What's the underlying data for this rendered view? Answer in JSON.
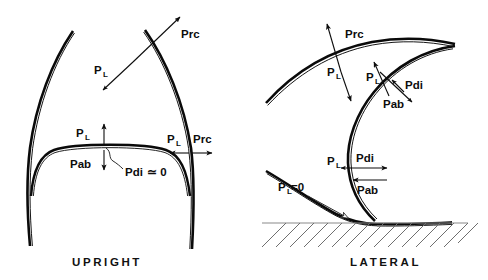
{
  "figure": {
    "background_color": "#ffffff",
    "stroke_color": "#0a0a0a",
    "ground_hatch_color": "#6f6f6f",
    "width": 488,
    "height": 280
  },
  "panels": [
    {
      "id": "upright",
      "caption": "UPRIGHT",
      "description": "Frontal view: chest wall side arcs with a domed diaphragm between them.",
      "labels": [
        {
          "key": "prc_top",
          "base": "Prc",
          "subscript": "",
          "suffix": "",
          "meaning": "recoil pressure of the chest wall",
          "arrow": "outward-up-right"
        },
        {
          "key": "pl_top",
          "base": "P",
          "subscript": "L",
          "suffix": "",
          "meaning": "transpulmonary pressure",
          "arrow": "inward-down-left"
        },
        {
          "key": "pl_dome",
          "base": "P",
          "subscript": "L",
          "suffix": "",
          "meaning": "transpulmonary pressure at the diaphragm dome",
          "arrow": "up"
        },
        {
          "key": "pab_dome",
          "base": "Pab",
          "subscript": "",
          "suffix": "",
          "meaning": "abdominal pressure at the diaphragm dome",
          "arrow": "down"
        },
        {
          "key": "pdi_dome",
          "base": "Pdi",
          "subscript": "",
          "suffix": " ≃ 0",
          "meaning": "transdiaphragmatic pressure approximately zero",
          "arrow": "leader-squiggle"
        },
        {
          "key": "pl_side",
          "base": "P",
          "subscript": "L",
          "suffix": "",
          "meaning": "transpulmonary pressure at the lateral chest wall",
          "arrow": "left"
        },
        {
          "key": "prc_side",
          "base": "Prc",
          "subscript": "",
          "suffix": "",
          "meaning": "chest wall recoil pressure at the lateral chest wall",
          "arrow": "right"
        }
      ]
    },
    {
      "id": "lateral",
      "caption": "LATERAL",
      "description": "Side-lying view: chest wall arc above, C-shaped diaphragm, dependent chest wall resting on hatched ground.",
      "labels": [
        {
          "key": "prc_top",
          "base": "Prc",
          "subscript": "",
          "suffix": "",
          "meaning": "recoil pressure of the chest wall",
          "arrow": "up-left"
        },
        {
          "key": "pl_top",
          "base": "P",
          "subscript": "L",
          "suffix": "",
          "meaning": "transpulmonary pressure",
          "arrow": "down-right"
        },
        {
          "key": "pl_mid",
          "base": "P",
          "subscript": "L",
          "suffix": "",
          "meaning": "transpulmonary pressure across the non-dependent diaphragm",
          "arrow": "up-right"
        },
        {
          "key": "pdi_mid",
          "base": "Pdi",
          "subscript": "",
          "suffix": "",
          "meaning": "transdiaphragmatic pressure",
          "arrow": "up-right-short"
        },
        {
          "key": "pab_mid",
          "base": "Pab",
          "subscript": "",
          "suffix": "",
          "meaning": "abdominal pressure",
          "arrow": "down-right"
        },
        {
          "key": "pl_low",
          "base": "P",
          "subscript": "L",
          "suffix": "",
          "meaning": "transpulmonary pressure near the dependent diaphragm",
          "arrow": "left-short"
        },
        {
          "key": "pdi_low",
          "base": "Pdi",
          "subscript": "",
          "suffix": "",
          "meaning": "transdiaphragmatic pressure at dependent region",
          "arrow": "right"
        },
        {
          "key": "pab_low",
          "base": "Pab",
          "subscript": "",
          "suffix": "",
          "meaning": "abdominal pressure at dependent region",
          "arrow": "left"
        },
        {
          "key": "pl_zero",
          "base": "P",
          "subscript": "L",
          "suffix": "=0",
          "meaning": "transpulmonary pressure equals zero at the dependent contact point",
          "arrow": "leader-to-contact"
        }
      ]
    }
  ]
}
